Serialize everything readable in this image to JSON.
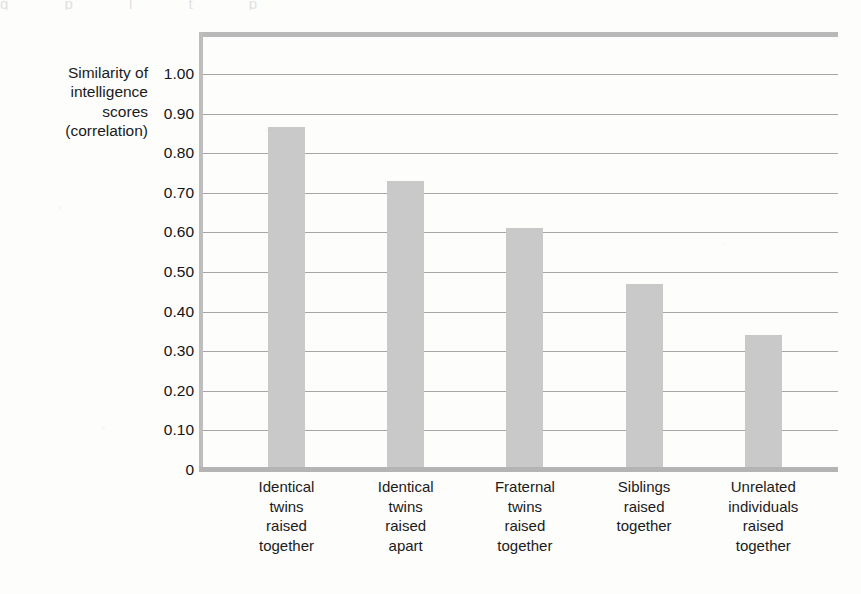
{
  "chart_data": {
    "type": "bar",
    "title": "",
    "subtitle": "",
    "xlabel": "",
    "ylabel": "Similarity of intelligence scores (correlation)",
    "ylabel_lines": [
      "Similarity of",
      "intelligence",
      "scores",
      "(correlation)"
    ],
    "ylim": [
      0,
      1.0
    ],
    "ytick_values": [
      1.0,
      0.9,
      0.8,
      0.7,
      0.6,
      0.5,
      0.4,
      0.3,
      0.2,
      0.1,
      0
    ],
    "ytick_labels": [
      "1.00",
      "0.90",
      "0.80",
      "0.70",
      "0.60",
      "0.50",
      "0.40",
      "0.30",
      "0.20",
      "0.10",
      "0"
    ],
    "grid": true,
    "grid_axis": "y",
    "legend": false,
    "legend_position": "none",
    "categories": [
      "Identical twins raised together",
      "Identical twins raised apart",
      "Fraternal twins raised together",
      "Siblings raised together",
      "Unrelated individuals raised together"
    ],
    "category_label_lines": [
      [
        "Identical",
        "twins",
        "raised",
        "together"
      ],
      [
        "Identical",
        "twins",
        "raised",
        "apart"
      ],
      [
        "Fraternal",
        "twins",
        "raised",
        "together"
      ],
      [
        "Siblings",
        "raised",
        "together"
      ],
      [
        "Unrelated",
        "individuals",
        "raised",
        "together"
      ]
    ],
    "values": [
      0.86,
      0.725,
      0.605,
      0.465,
      0.335
    ],
    "bar_color": "#c9c9c9",
    "gridline_color": "#a6a6a6",
    "frame_color": "#b7b7b7",
    "text_color": "#1a1a1a",
    "background_color": "#fdfdfc"
  },
  "bleed": {
    "top_fragment": "g p  l  t  p"
  }
}
